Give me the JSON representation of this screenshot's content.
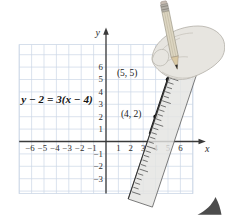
{
  "figure": {
    "equation": "y − 2 = 3(x − 4)",
    "point_labels": {
      "p42": "(4, 2)",
      "p55": "(5, 5)"
    }
  },
  "chart_data": {
    "type": "line",
    "equation": "y − 2 = 3(x − 4)",
    "slope": 3,
    "points": [
      {
        "x": 4,
        "y": 2,
        "label": "(4, 2)"
      },
      {
        "x": 5,
        "y": 5,
        "label": "(5, 5)"
      }
    ],
    "x_ticks": [
      -6,
      -5,
      -4,
      -3,
      -2,
      -1,
      1,
      2,
      3,
      4,
      5,
      6
    ],
    "y_ticks": [
      6,
      5,
      4,
      3,
      2,
      1,
      -1,
      -2,
      -3
    ],
    "xlabel": "x",
    "ylabel": "y",
    "xlim": [
      -7,
      7
    ],
    "ylim": [
      -4.2,
      7.8
    ],
    "grid": true,
    "legend": false
  },
  "palette": {
    "grid": "#ccd7e6",
    "axis": "#3a3a3a",
    "line": "#161616",
    "ruler_fill": "#e4e4e2",
    "ruler_tick": "#3d3d3d",
    "pencil_body": "#ddd6c2",
    "pencil_wood": "#d9c8a2",
    "ferrule": "#b4b0a8",
    "eraser": "#c7bcb2",
    "hand_fill": "#e7e5e0",
    "page_corner": "#4c4c4c"
  }
}
